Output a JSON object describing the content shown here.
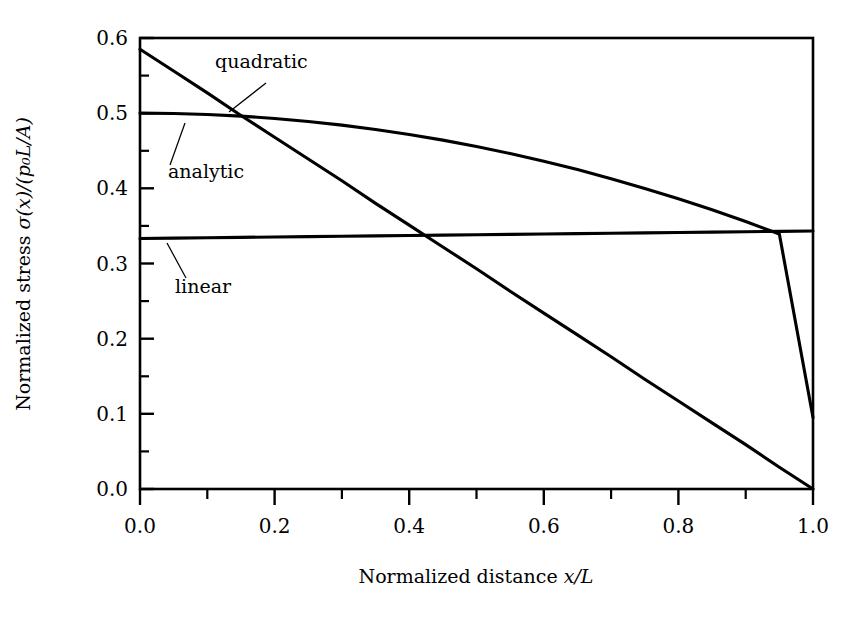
{
  "figure": {
    "background_color": "#ffffff",
    "line_color": "#000000",
    "width": 865,
    "height": 627
  },
  "axes": {
    "x_title": "Normalized distance x/L",
    "x_title_parts": {
      "prefix": "Normalized distance ",
      "math": "x/L"
    },
    "y_title": "Normalized stress σ(x)/(p₀L/A)",
    "y_title_parts": {
      "prefix": "Normalized stress ",
      "math": "σ(x)/(p₀L/A)"
    },
    "x_ticks": [
      "0.0",
      "0.2",
      "0.4",
      "0.6",
      "0.8",
      "1.0"
    ],
    "y_ticks": [
      "0.0",
      "0.1",
      "0.2",
      "0.3",
      "0.4",
      "0.5",
      "0.6"
    ],
    "x_minor_count": 1,
    "y_minor_count": 1,
    "frame": "box"
  },
  "annotations": [
    {
      "name": "quadratic",
      "label": "quadratic",
      "text_x": 215,
      "text_y": 68
    },
    {
      "name": "analytic",
      "label": "analytic",
      "text_x": 168,
      "text_y": 178
    },
    {
      "name": "linear",
      "label": "linear",
      "text_x": 175,
      "text_y": 293
    }
  ],
  "chart_data": {
    "type": "line",
    "title": "",
    "xlabel": "Normalized distance x/L",
    "ylabel": "Normalized stress σ(x)/(p₀L/A)",
    "xlim": [
      0.0,
      1.0
    ],
    "ylim": [
      0.0,
      0.6
    ],
    "grid": false,
    "legend": "inline-annotations",
    "x": [
      0.0,
      0.05,
      0.1,
      0.15,
      0.2,
      0.25,
      0.3,
      0.35,
      0.4,
      0.45,
      0.5,
      0.55,
      0.6,
      0.65,
      0.7,
      0.75,
      0.8,
      0.85,
      0.9,
      0.95,
      1.0
    ],
    "series": [
      {
        "name": "quadratic",
        "label": "quadratic",
        "values": [
          0.585,
          0.556,
          0.527,
          0.497,
          0.468,
          0.439,
          0.41,
          0.38,
          0.351,
          0.322,
          0.293,
          0.263,
          0.234,
          0.205,
          0.176,
          0.146,
          0.117,
          0.088,
          0.059,
          0.029,
          0.0
        ]
      },
      {
        "name": "analytic",
        "label": "analytic",
        "values": [
          0.5,
          0.4996,
          0.4983,
          0.4961,
          0.493,
          0.489,
          0.4841,
          0.4783,
          0.4717,
          0.4641,
          0.4556,
          0.4463,
          0.436,
          0.4249,
          0.4128,
          0.3999,
          0.3861,
          0.3714,
          0.3558,
          0.3392,
          0.095
        ]
      },
      {
        "name": "linear",
        "label": "linear",
        "values": [
          0.3333,
          0.3338,
          0.3343,
          0.3348,
          0.3353,
          0.3358,
          0.3363,
          0.3368,
          0.3373,
          0.3378,
          0.3383,
          0.3388,
          0.3393,
          0.3398,
          0.3403,
          0.3408,
          0.3413,
          0.3418,
          0.3423,
          0.3428,
          0.3433
        ]
      }
    ],
    "notes": {
      "quadratic_endpoints": {
        "x0_y": 0.585,
        "x1_y": 0.0
      },
      "analytic_endpoints": {
        "x0_y": 0.5,
        "x1_y": 0.095
      },
      "linear_endpoints": {
        "x0_y": 0.333,
        "x1_y": 0.343
      },
      "crossing_quadratic_analytic": {
        "x": 0.21,
        "y": 0.487
      },
      "crossing_quadratic_linear": {
        "x": 0.5,
        "y": 0.337
      },
      "crossing_analytic_linear": {
        "x": 0.575,
        "y": 0.339
      },
      "crossing_quadratic_analytic_second": {
        "x": 0.785,
        "y": 0.2
      }
    }
  }
}
